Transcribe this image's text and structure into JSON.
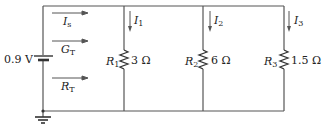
{
  "diagram": {
    "type": "parallel-circuit",
    "source": {
      "label": "0.9 V"
    },
    "left_branch_labels": [
      {
        "symbol": "I",
        "subscript": "s"
      },
      {
        "symbol": "G",
        "subscript": "T"
      },
      {
        "symbol": "R",
        "subscript": "T"
      }
    ],
    "branches": [
      {
        "resistor": "R",
        "resistor_sub": "1",
        "value": "3 Ω",
        "current": "I",
        "current_sub": "1"
      },
      {
        "resistor": "R",
        "resistor_sub": "2",
        "value": "6 Ω",
        "current": "I",
        "current_sub": "2"
      },
      {
        "resistor": "R",
        "resistor_sub": "3",
        "value": "1.5 Ω",
        "current": "I",
        "current_sub": "3"
      }
    ],
    "ground": "ground-symbol",
    "colors": {
      "wire": "#555555",
      "text": "#222222",
      "background": "#ffffff"
    }
  }
}
